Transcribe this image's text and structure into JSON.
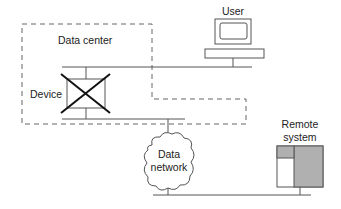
{
  "diagram": {
    "labels": {
      "data_center": "Data center",
      "user": "User",
      "device": "Device",
      "network_line1": "Data",
      "network_line2": "network",
      "remote_line1": "Remote",
      "remote_line2": "system"
    },
    "colors": {
      "line": "#555555",
      "dash": "#666666",
      "cross": "#111111",
      "remote_fill": "#b0b0b0"
    }
  }
}
